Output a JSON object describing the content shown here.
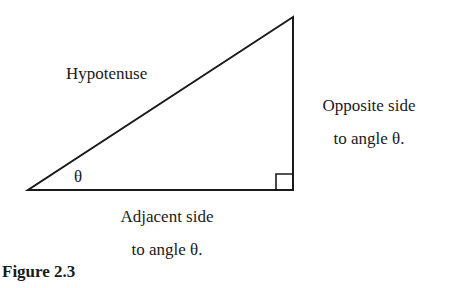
{
  "labels": {
    "hypotenuse": "Hypotenuse",
    "opposite_line1": "Opposite side",
    "opposite_line2": "to angle θ.",
    "adjacent_line1": "Adjacent side",
    "adjacent_line2": "to angle θ.",
    "angle": "θ"
  },
  "caption": "Figure 2.3"
}
